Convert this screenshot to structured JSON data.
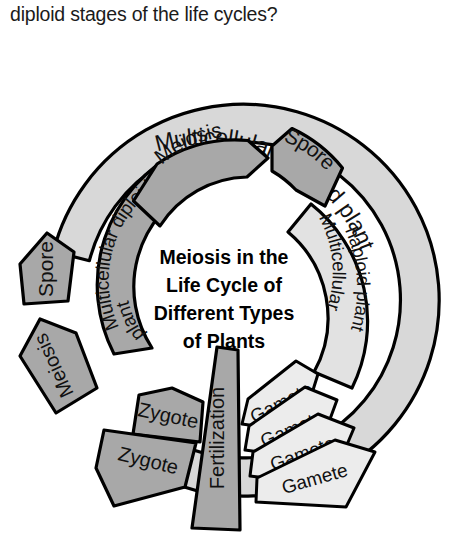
{
  "question": {
    "text": "diploid stages of the life cycles?"
  },
  "center": {
    "lines": [
      "Meiosis in the",
      "Life Cycle of",
      "Different Types",
      "of Plants"
    ]
  },
  "colors": {
    "outer_ring_fill": "#d8d8d8",
    "inner_dark_fill": "#a8a8a8",
    "inner_light_fill": "#e2e2e2",
    "gamete_fill": "#ececec",
    "stroke": "#000000",
    "page_background": "#ffffff",
    "text": "#111111"
  },
  "segments": {
    "outer_ring": {
      "label": "Multicellular haploid plant",
      "fill_key": "outer_ring_fill",
      "position": "outer-arc-top-right"
    },
    "inner_left_arc": {
      "label": "Multicellular diploid plant",
      "line1": "Multicellular diploid",
      "line2": "plant",
      "fill_key": "inner_dark_fill",
      "position": "inner-arc-upper-left"
    },
    "inner_right_arc": {
      "label": "Multicellular haploid plant",
      "line1": "Multicellular",
      "line2": "haploid plant",
      "fill_key": "inner_light_fill",
      "position": "inner-arc-right"
    },
    "meiosis_top": {
      "label": "Meiosis",
      "fill_key": "inner_dark_fill",
      "position": "inner-top-center"
    },
    "spore_top": {
      "label": "Spore",
      "fill_key": "inner_dark_fill",
      "position": "inner-top-right"
    },
    "spore_left": {
      "label": "Spore",
      "fill_key": "inner_dark_fill",
      "position": "outer-left-detached"
    },
    "meiosis_left": {
      "label": "Meiosis",
      "fill_key": "inner_dark_fill",
      "position": "outer-lower-left-detached"
    },
    "fertilization": {
      "label": "Fertilization",
      "fill_key": "inner_dark_fill",
      "position": "bottom-center-wedge"
    }
  },
  "zygotes": [
    {
      "label": "Zygote",
      "fill_key": "inner_dark_fill"
    },
    {
      "label": "Zygote",
      "fill_key": "inner_dark_fill"
    }
  ],
  "gametes": [
    {
      "label": "Gamete",
      "fill_key": "gamete_fill"
    },
    {
      "label": "Gamete",
      "fill_key": "gamete_fill"
    },
    {
      "label": "Gamete",
      "fill_key": "gamete_fill"
    },
    {
      "label": "Gamete",
      "fill_key": "gamete_fill"
    }
  ]
}
